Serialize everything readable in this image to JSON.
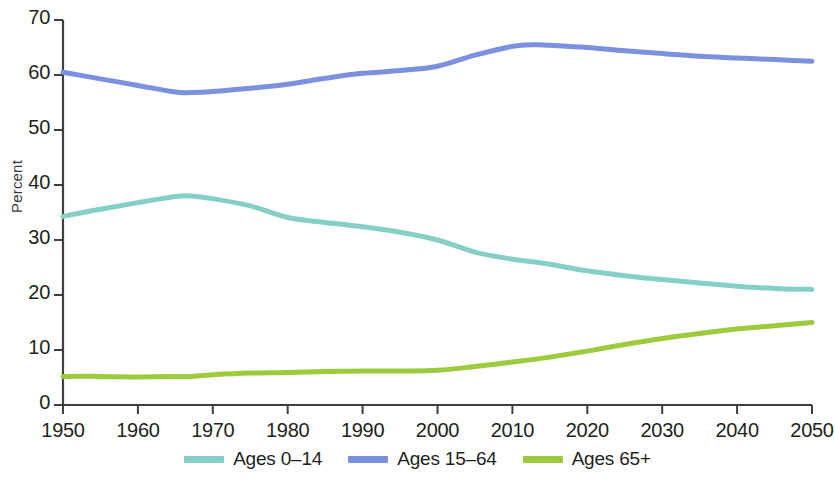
{
  "chart_data": {
    "type": "line",
    "title": "",
    "xlabel": "",
    "ylabel": "Percent",
    "xlim": [
      1950,
      2050
    ],
    "ylim": [
      0,
      70
    ],
    "grid": false,
    "legend_position": "bottom-center",
    "xticks": [
      "1950",
      "1960",
      "1970",
      "1980",
      "1990",
      "2000",
      "2010",
      "2020",
      "2030",
      "2040",
      "2050"
    ],
    "yticks": [
      "0",
      "10",
      "20",
      "30",
      "40",
      "50",
      "60",
      "70"
    ],
    "x": [
      1950,
      1955,
      1960,
      1965,
      1967,
      1970,
      1975,
      1980,
      1985,
      1990,
      1995,
      2000,
      2005,
      2010,
      2013,
      2015,
      2020,
      2025,
      2030,
      2035,
      2040,
      2045,
      2050
    ],
    "series": [
      {
        "name": "Ages 0-14",
        "color": "#86cfc9",
        "values": [
          34.3,
          35.6,
          36.8,
          37.9,
          38.0,
          37.5,
          36.2,
          34.1,
          33.2,
          32.4,
          31.4,
          30.0,
          27.8,
          26.5,
          26.0,
          25.6,
          24.4,
          23.5,
          22.8,
          22.2,
          21.6,
          21.2,
          21.0
        ]
      },
      {
        "name": "Ages 15-64",
        "color": "#7b90de",
        "values": [
          60.5,
          59.3,
          58.1,
          56.9,
          56.8,
          57.0,
          57.6,
          58.3,
          59.4,
          60.3,
          60.8,
          61.6,
          63.6,
          65.2,
          65.5,
          65.4,
          65.0,
          64.4,
          63.9,
          63.4,
          63.1,
          62.8,
          62.5
        ]
      },
      {
        "name": "Ages 65+",
        "color": "#9ecb3d",
        "values": [
          5.2,
          5.2,
          5.1,
          5.2,
          5.2,
          5.5,
          5.8,
          5.9,
          6.1,
          6.2,
          6.2,
          6.3,
          7.0,
          7.8,
          8.3,
          8.7,
          9.8,
          11.0,
          12.1,
          13.0,
          13.8,
          14.4,
          15.0
        ]
      }
    ]
  },
  "legend": {
    "items": [
      {
        "label": "Ages 0–14",
        "color": "#86cfc9"
      },
      {
        "label": "Ages 15–64",
        "color": "#7b90de"
      },
      {
        "label": "Ages 65+",
        "color": "#9ecb3d"
      }
    ]
  },
  "axes": {
    "y_title": "Percent"
  }
}
